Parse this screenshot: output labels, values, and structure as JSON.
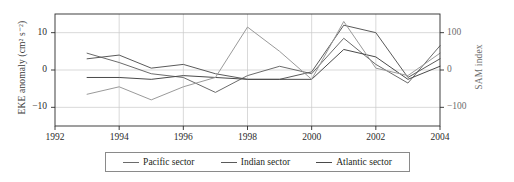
{
  "chart_data": {
    "type": "line",
    "title": "",
    "xlabel": "",
    "ylabel": "EKE anomaly (cm² s⁻²)",
    "y2label": "SAM index",
    "xlim": [
      1992,
      2004
    ],
    "ylim": [
      -15,
      15
    ],
    "y2lim": [
      -150,
      150
    ],
    "xticks": [
      1992,
      1994,
      1996,
      1998,
      2000,
      2002,
      2004
    ],
    "xtick_labels": [
      "1992",
      "1994",
      "1996",
      "1998",
      "2000",
      "2002",
      "2004"
    ],
    "yticks": [
      -10,
      0,
      10
    ],
    "ytick_labels": [
      "−10",
      "0",
      "10"
    ],
    "y2ticks": [
      -100,
      0,
      100
    ],
    "y2tick_labels": [
      "−100",
      "0",
      "100"
    ],
    "grid": true,
    "legend_position": "below",
    "x": [
      1993,
      1994,
      1995,
      1996,
      1997,
      1998,
      1999,
      2000,
      2001,
      2002,
      2003,
      2004
    ],
    "series": [
      {
        "name": "Pacific sector",
        "color": "#6b6b6b",
        "axis": "left",
        "values": [
          4.5,
          2.0,
          -1.0,
          -2.0,
          -6.0,
          -1.5,
          1.0,
          -1.0,
          8.5,
          1.5,
          -3.5,
          6.5
        ]
      },
      {
        "name": "Indian sector",
        "color": "#5a5a5a",
        "axis": "left",
        "values": [
          3.0,
          4.0,
          0.5,
          1.5,
          -1.0,
          -2.5,
          -2.5,
          -0.5,
          12.0,
          10.0,
          -2.0,
          3.0
        ]
      },
      {
        "name": "Atlantic sector",
        "color": "#4a4a4a",
        "axis": "left",
        "values": [
          -2.0,
          -2.0,
          -2.5,
          -1.5,
          -2.0,
          -2.5,
          -2.5,
          -2.5,
          5.5,
          3.5,
          -2.5,
          1.0
        ]
      },
      {
        "name": "SAM index",
        "color": "#9a9a9a",
        "axis": "right",
        "values": [
          -65,
          -45,
          -80,
          -45,
          -20,
          115,
          50,
          -25,
          130,
          5,
          -15,
          45
        ]
      }
    ]
  },
  "axes": {
    "left_title": "EKE anomaly (cm² s⁻²)",
    "right_title": "SAM index"
  },
  "legend": {
    "items": [
      {
        "label": "Pacific sector"
      },
      {
        "label": "Indian sector"
      },
      {
        "label": "Atlantic sector"
      }
    ]
  },
  "colors": {
    "axis": "#2b2b2b",
    "grid": "#c9c9c9",
    "right_axis_text": "#6e6e6e"
  }
}
